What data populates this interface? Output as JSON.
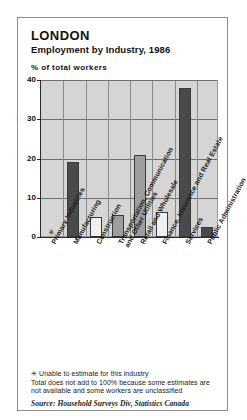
{
  "card": {
    "title": "LONDON",
    "subtitle": "Employment by Industry, 1986"
  },
  "notes": {
    "star_symbol": "✳",
    "star_note": "Unable to estimate for this industry",
    "total_note": "Total does not add to 100% because some estimates are not available and some workers are unclassified",
    "source": "Source: Household Surveys Div, Statistics Canada"
  },
  "colors": {
    "plot_background": "#d5d5d5",
    "gridline": "#6f6f6f",
    "axis": "#2b2b2b",
    "bar_dark": "#4a4a4a",
    "bar_medium": "#9d9d9d",
    "bar_light": "#f0f0f0",
    "bar_outline": "#3a3a3a",
    "border": "#8d8d8d"
  },
  "chart_data": {
    "type": "bar",
    "subtitle": "Employment by Industry, 1986",
    "xlabel": "",
    "ylabel": "% of total workers",
    "ylim": [
      0,
      40
    ],
    "yticks": [
      0,
      10,
      20,
      30,
      40
    ],
    "ytick_labels": [
      "0",
      "10",
      "20",
      "30",
      "40"
    ],
    "grid": true,
    "legend": "none",
    "categories": [
      "Primary Industries",
      "Manufacturing",
      "Construction",
      "Transportation, Communication\nand Other Utilities",
      "Retail and Wholesale",
      "Finance, Insurance and Real Estate",
      "Services",
      "Public Administration"
    ],
    "values": [
      null,
      19,
      5,
      5.5,
      21,
      6.5,
      38,
      2.5
    ],
    "value_notes": [
      "unable to estimate",
      "",
      "",
      "",
      "",
      "",
      "",
      ""
    ],
    "bar_styles": [
      "none",
      "dark",
      "light",
      "medium",
      "medium",
      "light",
      "dark",
      "dark"
    ]
  }
}
